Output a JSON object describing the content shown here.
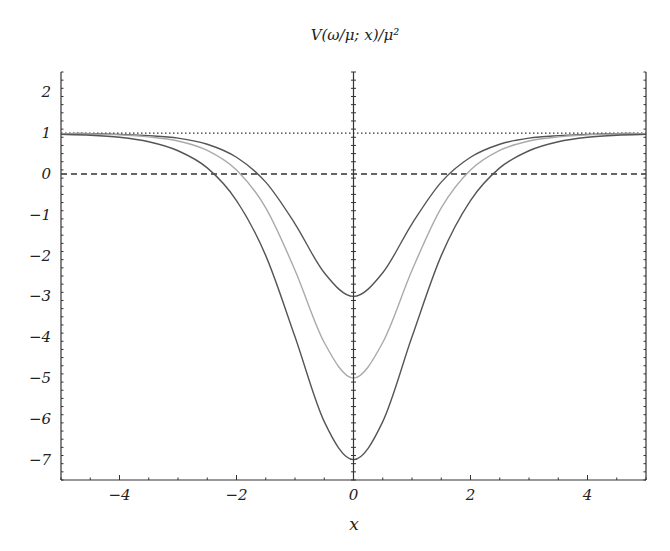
{
  "chart_data": {
    "type": "line",
    "title": "V(ω/μ; x)/μ²",
    "xlabel": "x",
    "ylabel": "",
    "xlim": [
      -5,
      5
    ],
    "ylim": [
      -7.5,
      2.5
    ],
    "xticks": [
      -4,
      -2,
      0,
      2,
      4
    ],
    "xtick_labels": [
      "−4",
      "−2",
      "0",
      "2",
      "4"
    ],
    "yticks": [
      2,
      1,
      0,
      -1,
      -2,
      -3,
      -4,
      -5,
      -6,
      -7
    ],
    "ytick_labels": [
      "2",
      "1",
      "0",
      "−1",
      "−2",
      "−3",
      "−4",
      "−5",
      "−6",
      "−7"
    ],
    "grid": false,
    "legend": null,
    "reference_lines": [
      {
        "name": "asymptote",
        "y": 1,
        "style": "dotted",
        "color": "#333333"
      },
      {
        "name": "zero",
        "y": 0,
        "style": "dashed",
        "color": "#333333"
      }
    ],
    "x": [
      -5,
      -4.5,
      -4,
      -3.5,
      -3,
      -2.5,
      -2,
      -1.5,
      -1,
      -0.5,
      0,
      0.5,
      1,
      1.5,
      2,
      2.5,
      3,
      3.5,
      4,
      4.5,
      5
    ],
    "series": [
      {
        "name": "curve-min-3",
        "color": "#555555",
        "values": [
          0.99,
          0.99,
          0.97,
          0.94,
          0.88,
          0.73,
          0.41,
          -0.2,
          -1.22,
          -2.42,
          -3.0,
          -2.42,
          -1.22,
          -0.2,
          0.41,
          0.73,
          0.88,
          0.94,
          0.97,
          0.99,
          0.99
        ]
      },
      {
        "name": "curve-min-5",
        "color": "#aaaaaa",
        "values": [
          0.99,
          0.98,
          0.96,
          0.91,
          0.81,
          0.58,
          0.1,
          -0.83,
          -2.36,
          -4.13,
          -5.0,
          -4.13,
          -2.36,
          -0.83,
          0.1,
          0.58,
          0.81,
          0.91,
          0.96,
          0.98,
          0.99
        ]
      },
      {
        "name": "curve-min-7",
        "color": "#555555",
        "values": [
          0.97,
          0.95,
          0.9,
          0.79,
          0.57,
          0.15,
          -0.65,
          -2.0,
          -3.99,
          -6.07,
          -7.0,
          -6.07,
          -3.99,
          -2.0,
          -0.65,
          0.15,
          0.57,
          0.79,
          0.9,
          0.95,
          0.97
        ]
      }
    ]
  }
}
